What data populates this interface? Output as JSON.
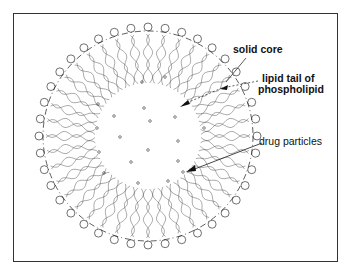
{
  "figure": {
    "type": "solid lipid nanoparticle cross-section",
    "labels": {
      "solid_core": "solid core",
      "lipid_tail_line1": "lipid tail of",
      "lipid_tail_line2": "phospholipid",
      "drug_particles": "drug particles"
    },
    "colors": {
      "line": "#333333",
      "background": "#ffffff",
      "frame": "#333333"
    },
    "geometry": {
      "center": [
        148,
        136
      ],
      "head_radius": 105,
      "core_radius": 52,
      "lipid_count": 40
    },
    "drug_particles": [
      [
        142,
        82
      ],
      [
        165,
        77
      ],
      [
        98,
        104
      ],
      [
        144,
        108
      ],
      [
        114,
        116
      ],
      [
        150,
        121
      ],
      [
        175,
        117
      ],
      [
        97,
        128
      ],
      [
        204,
        128
      ],
      [
        120,
        137
      ],
      [
        178,
        141
      ],
      [
        99,
        152
      ],
      [
        148,
        150
      ],
      [
        131,
        162
      ],
      [
        178,
        161
      ],
      [
        104,
        173
      ],
      [
        183,
        172
      ],
      [
        138,
        183
      ],
      [
        168,
        181
      ]
    ]
  }
}
